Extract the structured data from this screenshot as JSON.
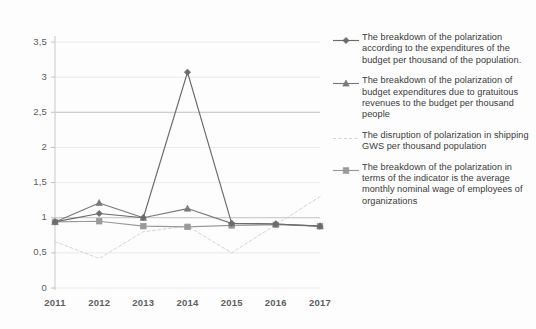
{
  "chart_data": {
    "type": "line",
    "title": "",
    "xlabel": "",
    "ylabel": "",
    "categories": [
      "2011",
      "2012",
      "2013",
      "2014",
      "2015",
      "2016",
      "2017"
    ],
    "x": [
      2011,
      2012,
      2013,
      2014,
      2015,
      2016,
      2017
    ],
    "ylim": [
      0,
      3.5
    ],
    "ytick_labels": [
      "0",
      "0,5",
      "1",
      "1,5",
      "2",
      "2,5",
      "3",
      "3,5"
    ],
    "ytick_values": [
      0,
      0.5,
      1,
      1.5,
      2,
      2.5,
      3,
      3.5
    ],
    "grid": true,
    "legend_position": "right",
    "decimal_separator": ",",
    "series": [
      {
        "name": "The breakdown of the polarization according to the expenditures of the budget per thousand of the population.",
        "marker": "diamond",
        "line_style": "solid",
        "color": "#6b6b6b",
        "values": [
          0.94,
          1.06,
          1.0,
          3.07,
          0.92,
          0.91,
          0.88
        ]
      },
      {
        "name": "The breakdown of the polarization of budget expenditures due to gratuitous revenues to the budget per thousand people",
        "marker": "triangle",
        "line_style": "solid",
        "color": "#7a7a7a",
        "values": [
          0.94,
          1.21,
          1.0,
          1.13,
          0.92,
          0.91,
          0.88
        ]
      },
      {
        "name": "The disruption of polarization in shipping GWS per thousand population",
        "marker": "none",
        "line_style": "dashed",
        "color": "#cfcfcf",
        "values": [
          0.66,
          0.42,
          0.8,
          0.88,
          0.5,
          0.9,
          1.3
        ]
      },
      {
        "name": "The breakdown of the polarization in terms of the indicator is the average monthly nominal wage of employees of organizations",
        "marker": "square",
        "line_style": "solid",
        "color": "#9a9a9a",
        "values": [
          0.94,
          0.95,
          0.88,
          0.87,
          0.89,
          0.9,
          0.88
        ]
      }
    ]
  },
  "legend": {
    "entries": [
      {
        "label": "The breakdown of the polarization according to the expenditures of the budget per thousand of the population."
      },
      {
        "label": "The breakdown of the polarization of budget expenditures due to gratuitous revenues to the budget per thousand people"
      },
      {
        "label": "The disruption of polarization in shipping GWS per thousand population"
      },
      {
        "label": "The breakdown of the polarization in terms of the indicator is the average monthly nominal wage of employees of organizations"
      }
    ]
  }
}
